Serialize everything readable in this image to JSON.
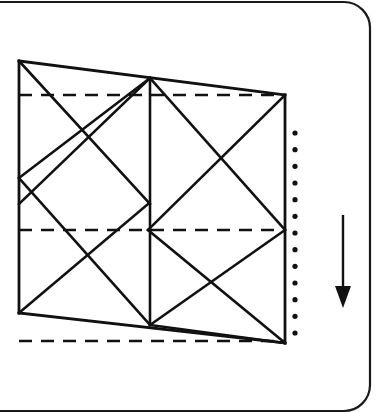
{
  "panel": {
    "name": "origami-crease-pattern-step",
    "background_color": "#ffffff",
    "width": 375,
    "height": 413,
    "border": {
      "name": "rounded-panel-border",
      "color": "#1a1a1a",
      "stroke_width": 2.2,
      "corner_radius": 26,
      "x": -40,
      "y": 2,
      "width": 410,
      "height": 409
    }
  },
  "line_styles": {
    "solid_color": "#111111",
    "solid_width": 2.6,
    "dashed_color": "#111111",
    "dashed_width": 2.6,
    "dash_pattern": "13,9",
    "dotted_color": "#111111",
    "dot_radius": 2.6,
    "arrow_color": "#111111",
    "arrow_width": 2.4
  },
  "figure": {
    "name": "paper-sheet-outline",
    "vertices": {
      "top_left": [
        19,
        61
      ],
      "top_mid": [
        150,
        78
      ],
      "top_right": [
        285,
        95
      ],
      "left_mid": [
        19,
        178
      ],
      "center": [
        148,
        204
      ],
      "right_mid": [
        285,
        230
      ],
      "bottom_left": [
        19,
        313
      ],
      "bottom_mid": [
        150,
        325
      ],
      "bottom_right": [
        285,
        343
      ]
    },
    "outline_solid": [
      {
        "name": "edge-top",
        "from": [
          19,
          61
        ],
        "to": [
          285,
          95
        ]
      },
      {
        "name": "edge-right",
        "from": [
          285,
          95
        ],
        "to": [
          285,
          343
        ]
      },
      {
        "name": "edge-bottom",
        "from": [
          19,
          313
        ],
        "to": [
          285,
          343
        ]
      },
      {
        "name": "edge-left",
        "from": [
          19,
          61
        ],
        "to": [
          19,
          313
        ]
      }
    ],
    "creases_solid": [
      {
        "name": "crease-vertical-center",
        "from": [
          150,
          78
        ],
        "to": [
          150,
          325
        ]
      },
      {
        "name": "crease-diag-tl-to-center",
        "from": [
          19,
          61
        ],
        "to": [
          150,
          204
        ]
      },
      {
        "name": "crease-diag-topmid-to-leftmid",
        "from": [
          150,
          78
        ],
        "to": [
          19,
          178
        ]
      },
      {
        "name": "crease-diag-topmid-to-center-left",
        "from": [
          150,
          78
        ],
        "to": [
          19,
          204
        ]
      },
      {
        "name": "crease-diag-topmid-to-rightmid",
        "from": [
          150,
          78
        ],
        "to": [
          285,
          230
        ]
      },
      {
        "name": "crease-diag-topright-to-center",
        "from": [
          285,
          95
        ],
        "to": [
          148,
          230
        ]
      },
      {
        "name": "crease-diag-leftmid-to-center-down",
        "from": [
          19,
          178
        ],
        "to": [
          150,
          325
        ]
      },
      {
        "name": "crease-diag-center-to-bottomleft",
        "from": [
          148,
          204
        ],
        "to": [
          19,
          313
        ]
      },
      {
        "name": "crease-diag-rightmid-to-bottommid",
        "from": [
          285,
          230
        ],
        "to": [
          150,
          325
        ]
      },
      {
        "name": "crease-diag-center-to-bottomright",
        "from": [
          148,
          230
        ],
        "to": [
          285,
          343
        ]
      },
      {
        "name": "crease-diag-bottommid-to-bottomright",
        "from": [
          150,
          325
        ],
        "to": [
          285,
          343
        ]
      }
    ],
    "creases_dashed": [
      {
        "name": "fold-line-upper",
        "from": [
          19,
          95
        ],
        "to": [
          285,
          95
        ]
      },
      {
        "name": "fold-line-middle",
        "from": [
          19,
          230
        ],
        "to": [
          285,
          230
        ]
      },
      {
        "name": "fold-line-lower",
        "from": [
          19,
          341
        ],
        "to": [
          285,
          341
        ]
      }
    ]
  },
  "dotted_guide": {
    "name": "dotted-vertical-guide",
    "x": 295,
    "y_start": 133,
    "y_end": 333,
    "dot_count": 13
  },
  "motion_arrow": {
    "name": "fold-direction-arrow",
    "direction": "down",
    "x": 343,
    "y_start": 215,
    "y_end": 308,
    "head_width": 16,
    "head_length": 22
  }
}
